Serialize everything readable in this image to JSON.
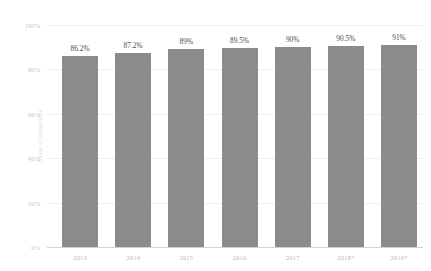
{
  "chart_data": {
    "type": "bar",
    "title": "",
    "subtitle": "",
    "xlabel": "",
    "ylabel": "Share of companies",
    "categories": [
      "2013",
      "2014",
      "2015",
      "2016",
      "2017",
      "2018*",
      "2019*"
    ],
    "values": [
      86.2,
      87.2,
      89,
      89.5,
      90,
      90.5,
      91
    ],
    "value_labels": [
      "86.2%",
      "87.2%",
      "89%",
      "89.5%",
      "90%",
      "90.5%",
      "91%"
    ],
    "ylim": [
      0,
      100
    ],
    "y_ticks": [
      0,
      20,
      40,
      60,
      80,
      100
    ],
    "y_tick_labels": [
      "0%",
      "20%",
      "40%",
      "60%",
      "80%",
      "100%"
    ],
    "grid": true,
    "legend": "none",
    "series": [
      {
        "name": "Share of companies",
        "values": [
          86.2,
          87.2,
          89,
          89.5,
          90,
          90.5,
          91
        ],
        "color": "#8b8b8b"
      }
    ],
    "colors": {
      "bar": "#8b8b8b",
      "gridline": "#efefef",
      "baseline": "#d2d2d2",
      "tick_text": "#bdbdbd",
      "value_text": "#4a4a4a",
      "background": "#ffffff"
    }
  }
}
